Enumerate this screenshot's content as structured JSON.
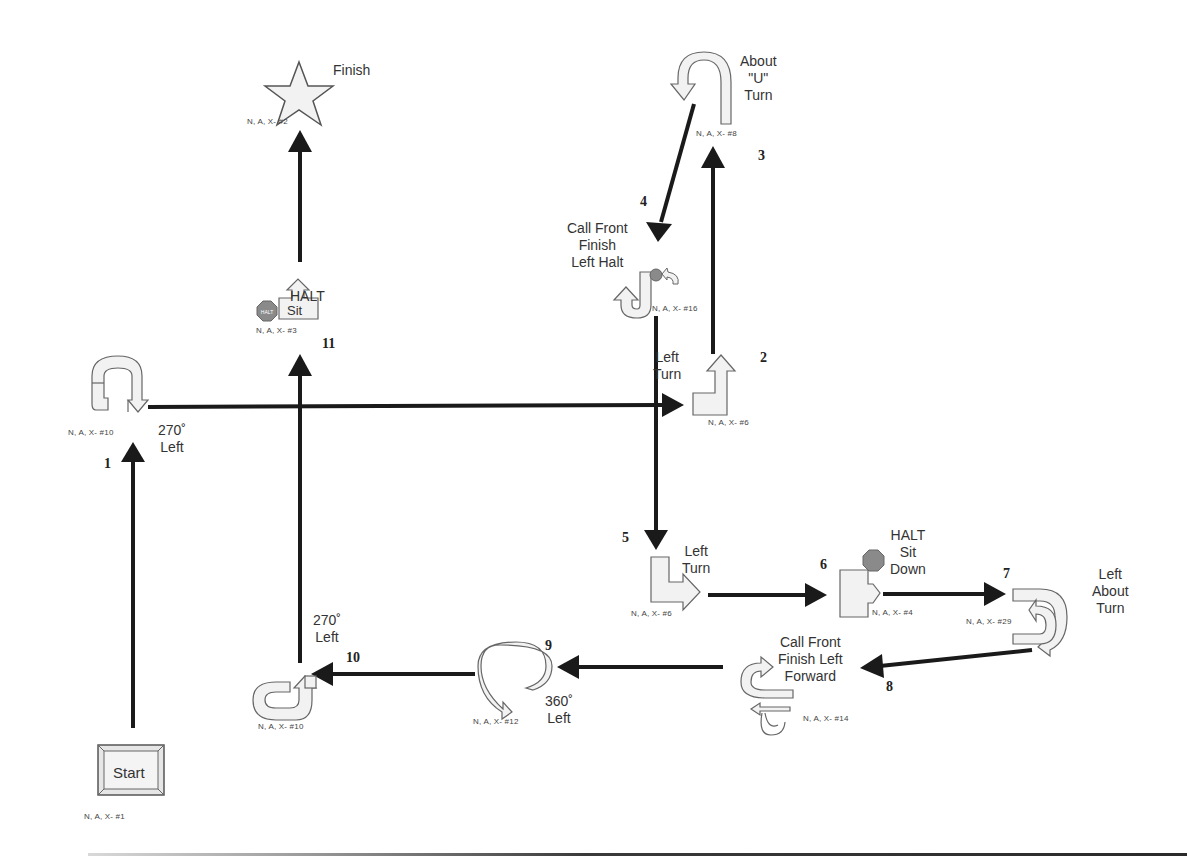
{
  "course": {
    "title": "",
    "stations": [
      {
        "id": 1,
        "name": "Start",
        "label": "Start",
        "code": "N, A, X- #1"
      },
      {
        "id": 2,
        "name": "Finish",
        "label": "Finish",
        "code": "N, A, X- #2"
      },
      {
        "id": 3,
        "name": "270 Left (top)",
        "label_line1": "270˚",
        "label_line2": "Left",
        "code": "N, A, X- #10"
      },
      {
        "id": 4,
        "name": "Left Turn (upper)",
        "label_line1": "Left",
        "label_line2": "Turn",
        "code": "N, A, X- #6"
      },
      {
        "id": 5,
        "name": "About U Turn",
        "label_line1": "About",
        "label_line2": "\"U\"",
        "label_line3": "Turn",
        "code": "N, A, X- #8"
      },
      {
        "id": 6,
        "name": "Call Front Finish Left Halt",
        "label_line1": "Call Front",
        "label_line2": "Finish",
        "label_line3": "Left Halt",
        "code": "N, A, X- #16"
      },
      {
        "id": 7,
        "name": "Left Turn (lower)",
        "label_line1": "Left",
        "label_line2": "Turn",
        "code": "N, A, X- #6"
      },
      {
        "id": 8,
        "name": "HALT Sit Down",
        "label_line1": "HALT",
        "label_line2": "Sit",
        "label_line3": "Down",
        "stop_text": "HALT",
        "code": "N, A, X- #4"
      },
      {
        "id": 9,
        "name": "Left About Turn",
        "label_line1": "Left",
        "label_line2": "About",
        "label_line3": "Turn",
        "code": "N, A, X- #29"
      },
      {
        "id": 10,
        "name": "Call Front Finish Left Forward",
        "label_line1": "Call Front",
        "label_line2": "Finish Left",
        "label_line3": "Forward",
        "code": "N, A, X- #14"
      },
      {
        "id": 11,
        "name": "360 Left",
        "label_line1": "360˚",
        "label_line2": "Left",
        "code": "N, A, X- #12"
      },
      {
        "id": 12,
        "name": "270 Left (bottom)",
        "label_line1": "270˚",
        "label_line2": "Left",
        "code": "N, A, X- #10"
      },
      {
        "id": 13,
        "name": "HALT Sit",
        "label": "HALT",
        "sign_text": "Sit",
        "stop_text": "HALT",
        "code": "N, A, X- #3"
      }
    ],
    "path_numbers": [
      "1",
      "2",
      "3",
      "4",
      "5",
      "6",
      "7",
      "8",
      "9",
      "10",
      "11"
    ],
    "colors": {
      "path_line": "#1a1a1a",
      "sign_fill": "#f2f2f2",
      "sign_stroke": "#666666",
      "stop_sign": "#8a8a8a"
    }
  }
}
